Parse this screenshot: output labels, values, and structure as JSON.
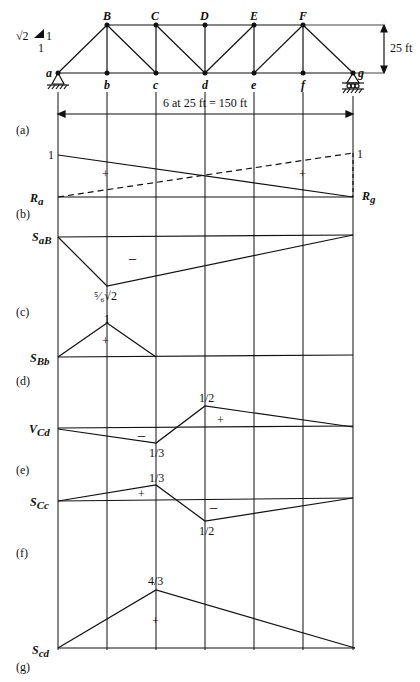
{
  "truss": {
    "top_nodes": [
      "B",
      "C",
      "D",
      "E",
      "F"
    ],
    "bottom_nodes": [
      "a",
      "b",
      "c",
      "d",
      "e",
      "f",
      "g"
    ],
    "slope_label": {
      "sqrt2": "√2",
      "vertical": "1",
      "horizontal": "1"
    },
    "height_label": "25 ft",
    "span_label": "6 at 25 ft = 150 ft"
  },
  "panels": {
    "a": {
      "tag": "(a)"
    },
    "b": {
      "tag": "(b)",
      "left_label": "R",
      "left_sub": "a",
      "right_label": "R",
      "right_sub": "g",
      "left_value": "1",
      "right_value": "1",
      "sign_left": "+",
      "sign_right": "+"
    },
    "c": {
      "tag": "(c)",
      "label": "S",
      "sub": "aB",
      "sign": "−",
      "peak_value": "⁵⁄₆√2"
    },
    "d": {
      "tag": "(d)",
      "label": "S",
      "sub": "Bb",
      "sign": "+",
      "peak_value": "1"
    },
    "e": {
      "tag": "(e)",
      "label": "V",
      "sub": "Cd",
      "neg_sign": "−",
      "pos_sign": "+",
      "neg_value": "1/3",
      "pos_value": "1/2"
    },
    "f": {
      "tag": "(f)",
      "label": "S",
      "sub": "Cc",
      "neg_sign": "−",
      "pos_sign": "+",
      "pos_value": "1/3",
      "neg_value": "1/2"
    },
    "g": {
      "tag": "(g)",
      "label": "S",
      "sub": "cd",
      "sign": "+",
      "peak_value": "4/3"
    }
  }
}
